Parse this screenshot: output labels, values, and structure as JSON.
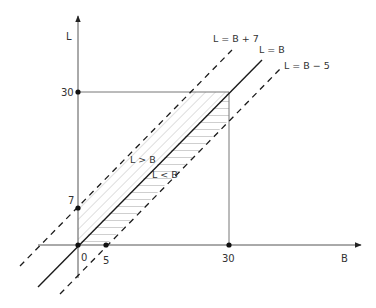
{
  "diagram": {
    "title": "",
    "axes": {
      "x_label": "B",
      "y_label": "L"
    },
    "ticks": {
      "origin": "0",
      "x_five": "5",
      "x_thirty": "30",
      "y_seven": "7",
      "y_thirty": "30"
    },
    "lines": {
      "upper": "L = B + 7",
      "middle": "L = B",
      "lower": "L = B − 5"
    },
    "regions": {
      "above": "L > B",
      "below": "L < B"
    },
    "colors": {
      "axis": "#555555",
      "line": "#1a1a1a",
      "hatch": "#b8b8b8",
      "square": "#777777"
    }
  }
}
